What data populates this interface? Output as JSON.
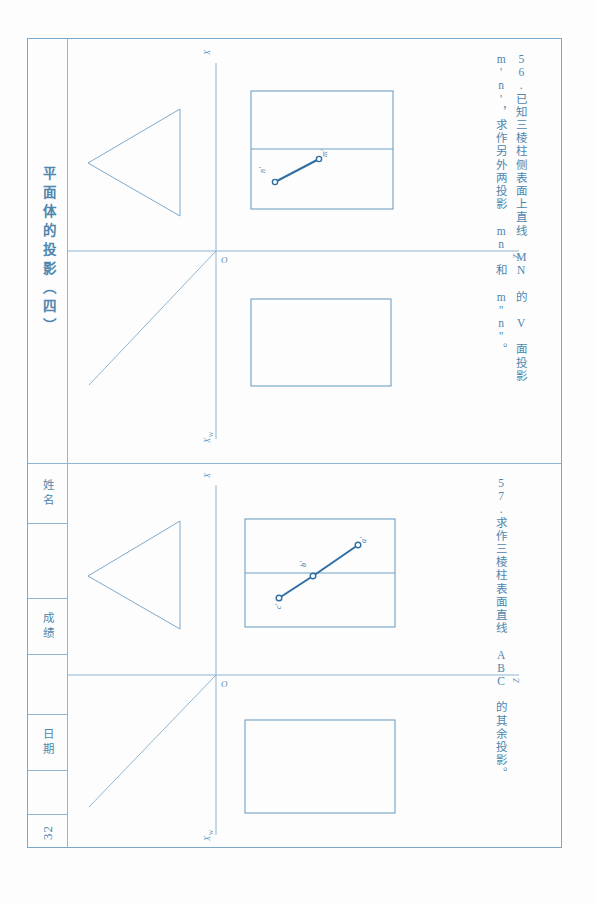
{
  "page": {
    "title": "平面体的投影（四）",
    "number": "32",
    "fields": [
      {
        "key": "name",
        "label": "姓名"
      },
      {
        "key": "score",
        "label": "成绩"
      },
      {
        "key": "date",
        "label": "日期"
      }
    ],
    "frame_color": "#7aa8c9",
    "ink_color": "#4e86ad",
    "answer_color": "#2f6da3"
  },
  "problems": [
    {
      "id": "56",
      "number": "56.",
      "text": "已知三棱柱侧表面上直线 MN 的 V 面投影 m'n'，求作另外两投影 mn 和 m\"n\"。",
      "drawing": {
        "axes": {
          "x_label": "X",
          "z_label": "Z",
          "origin_label": "O",
          "x_h_label": "X",
          "x_h_sub": "H",
          "x_w_label": "X",
          "x_w_sub": "W"
        },
        "triangle": {
          "comment": "left profile view: triangle pointing left"
        },
        "box_upper": {
          "divider": true
        },
        "box_lower": {
          "divider": false
        },
        "points": [
          {
            "label": "m'",
            "position": "upper-right"
          },
          {
            "label": "n'",
            "position": "lower-left"
          }
        ],
        "segment": {
          "from": "n'",
          "to": "m'"
        }
      }
    },
    {
      "id": "57",
      "number": "57.",
      "text": "求作三棱柱表面直线 ABC 的其余投影。",
      "drawing": {
        "axes": {
          "x_label": "X",
          "z_label": "Z",
          "origin_label": "O",
          "x_h_label": "X",
          "x_h_sub": "H",
          "x_w_label": "X",
          "x_w_sub": "W"
        },
        "triangle": {
          "comment": "left profile view: triangle pointing left"
        },
        "box_upper": {
          "divider": true
        },
        "box_lower": {
          "divider": false
        },
        "points": [
          {
            "label": "a'",
            "position": "upper-right"
          },
          {
            "label": "b'",
            "position": "middle"
          },
          {
            "label": "c'",
            "position": "lower-left"
          }
        ],
        "segment": {
          "from": "c'",
          "to": "a'",
          "via": "b'"
        }
      }
    }
  ]
}
